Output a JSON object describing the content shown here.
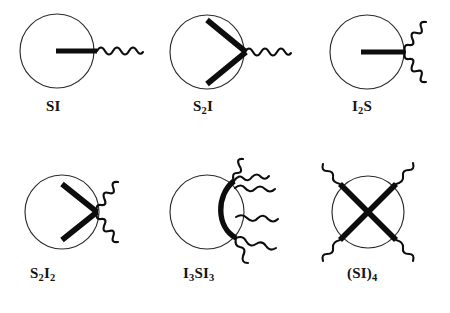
{
  "figure": {
    "background_color": "#ffffff",
    "ink_color": "#0d0d0d",
    "core_stroke_color": "#2b2b2b",
    "width": 450,
    "height": 313
  },
  "legend_semantics": {
    "circle": "micelle-core",
    "thick_straight_line": "S-block",
    "wavy_line": "I-block"
  },
  "structures": [
    {
      "id": "si",
      "label": "SI",
      "label_text": "SI",
      "row": 1,
      "column": 1,
      "s_arms": 1,
      "i_arms": 1,
      "circle": {
        "cx": 57,
        "cy": 51,
        "r": 37
      },
      "label_x": 46,
      "label_y": 105
    },
    {
      "id": "s2i",
      "label": "S2I",
      "label_base": "S",
      "label_sub1": "2",
      "label_tail": "I",
      "row": 1,
      "column": 2,
      "s_arms": 2,
      "i_arms": 1,
      "circle": {
        "cx": 207,
        "cy": 52,
        "r": 37
      },
      "label_x": 193,
      "label_y": 105
    },
    {
      "id": "i2s",
      "label": "I2S",
      "label_base": "I",
      "label_sub1": "2",
      "label_tail": "S",
      "row": 1,
      "column": 3,
      "s_arms": 1,
      "i_arms": 2,
      "circle": {
        "cx": 367,
        "cy": 52,
        "r": 37
      },
      "label_x": 352,
      "label_y": 105
    },
    {
      "id": "s2i2",
      "label": "S2I2",
      "label_base": "S",
      "label_sub1": "2",
      "label_mid": "I",
      "label_sub2": "2",
      "row": 2,
      "column": 1,
      "s_arms": 2,
      "i_arms": 2,
      "circle": {
        "cx": 62,
        "cy": 212,
        "r": 37
      },
      "label_x": 30,
      "label_y": 272
    },
    {
      "id": "i3si3",
      "label": "I3SI3",
      "label_base": "I",
      "label_sub1": "3",
      "label_mid": "S",
      "label_tail": "I",
      "label_sub2": "3",
      "row": 2,
      "column": 2,
      "s_arms": 1,
      "i_arms": 6,
      "circle": {
        "cx": 207,
        "cy": 212,
        "r": 37
      },
      "label_x": 183,
      "label_y": 272
    },
    {
      "id": "si4",
      "label": "(SI)4",
      "label_base": "(SI)",
      "label_sub1": "4",
      "row": 2,
      "column": 3,
      "s_arms": 4,
      "i_arms": 4,
      "circle": {
        "cx": 368,
        "cy": 212,
        "r": 36
      },
      "label_x": 347,
      "label_y": 272
    }
  ]
}
